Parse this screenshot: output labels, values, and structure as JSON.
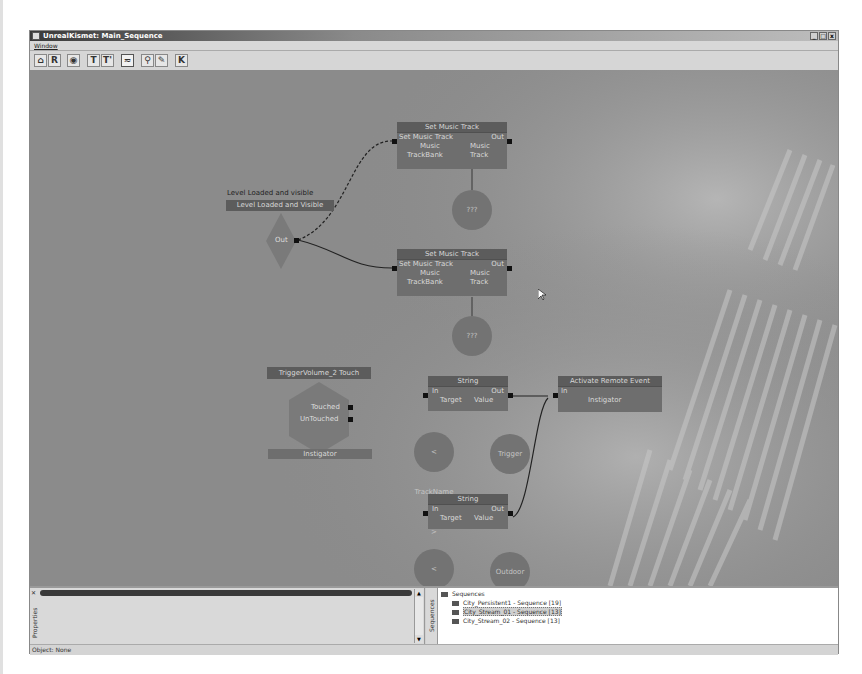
{
  "window": {
    "title": "UnrealKismet: Main_Sequence",
    "controls": [
      "_",
      "□",
      "x"
    ]
  },
  "menubar": {
    "items": [
      "Window"
    ]
  },
  "toolbar": {
    "buttons": [
      {
        "name": "home-icon",
        "glyph": "⌂"
      },
      {
        "name": "search-object-icon",
        "glyph": "R"
      },
      {
        "name": "eye-icon",
        "glyph": "◉"
      },
      {
        "name": "text-icon",
        "glyph": "T"
      },
      {
        "name": "text-parent-icon",
        "glyph": "T'"
      },
      {
        "name": "curve-icon",
        "glyph": "≂"
      },
      {
        "name": "zoom-icon",
        "glyph": "⚲"
      },
      {
        "name": "wrench-icon",
        "glyph": "✎"
      },
      {
        "name": "k-icon",
        "glyph": "K"
      }
    ]
  },
  "graph": {
    "event_level_loaded": {
      "caption": "Level Loaded and visible",
      "header": "Level Loaded and Visible",
      "out": "Out"
    },
    "music_track_1": {
      "header": "Set Music Track",
      "in": "Set Music Track",
      "out": "Out",
      "var_left": "Music\nTrackBank",
      "var_left_1": "Music",
      "var_left_2": "TrackBank",
      "var_right_1": "Music",
      "var_right_2": "Track",
      "var_circle": "???"
    },
    "music_track_2": {
      "header": "Set Music Track",
      "in": "Set Music Track",
      "out": "Out",
      "var_left_1": "Music",
      "var_left_2": "TrackBank",
      "var_right_1": "Music",
      "var_right_2": "Track",
      "var_circle": "???"
    },
    "trigger_touch": {
      "header": "TriggerVolume_2 Touch",
      "touched": "Touched",
      "untouched": "UnTouched",
      "instigator": "Instigator"
    },
    "string_1": {
      "header": "String",
      "in": "In",
      "out": "Out",
      "target": "Target",
      "value": "Value",
      "circle_target": "< TrackName >",
      "circle_value": "Trigger"
    },
    "string_2": {
      "header": "String",
      "in": "In",
      "out": "Out",
      "target": "Target",
      "value": "Value",
      "circle_target": "< TrackName >",
      "circle_value": "Outdoor"
    },
    "remote_event": {
      "header": "Activate Remote Event",
      "in": "In",
      "instigator": "Instigator"
    }
  },
  "properties_panel": {
    "tab_label": "Properties"
  },
  "sequences_panel": {
    "tab_label": "Sequences",
    "root": "Sequences",
    "items": [
      {
        "label": "City_Persistent1 - Sequence [19]",
        "selected": false
      },
      {
        "label": "City_Stream_01 - Sequence [13]",
        "selected": true
      },
      {
        "label": "City_Stream_02 - Sequence [13]",
        "selected": false
      }
    ]
  },
  "status_bar": {
    "text": "Object: None"
  }
}
